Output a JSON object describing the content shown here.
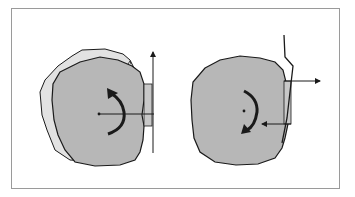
{
  "figure": {
    "type": "schematic-diagram",
    "panels": [
      {
        "id": "left",
        "description": "Two overlapping irregular blobs (lighter one behind, grey one in front) with a rectangle at the right edge, a vertical upward arrow, a horizontal lever line from a center dot, and a counter-clockwise curved rotation arrow",
        "rotation_direction": "counter-clockwise",
        "force_arrows": [
          "up"
        ]
      },
      {
        "id": "right",
        "description": "Single grey irregular blob with a rectangle at its right edge, a bent zig-zag line, two horizontal arrows (right at top, left at bottom), a center dot and a clockwise curved rotation arrow",
        "rotation_direction": "clockwise",
        "force_arrows": [
          "right",
          "left"
        ]
      }
    ]
  },
  "colors": {
    "blob_fill": "#b7b7b7",
    "back_blob_fill": "#e2e2e2",
    "stroke": "#1a1a1a",
    "frame": "#9a9a9a",
    "rect_fill": "#c8c8c8",
    "background": "#ffffff"
  }
}
